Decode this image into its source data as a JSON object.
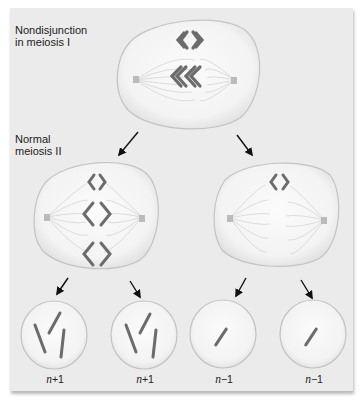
{
  "title_labels": {
    "stage1": "Nondisjunction\nin meiosis I",
    "stage1_line1": "Nondisjunction",
    "stage1_line2": "in meiosis I",
    "stage2_line1": "Normal",
    "stage2_line2": "meiosis II"
  },
  "cells": {
    "parent": {
      "stage": "Nondisjunction in meiosis I",
      "chromosome_pairs": 2
    },
    "meiosis2_left": {
      "stage": "Normal meiosis II",
      "chromosome_pairs": 3
    },
    "meiosis2_right": {
      "stage": "Normal meiosis II",
      "chromosome_pairs": 1
    }
  },
  "gametes": [
    {
      "var": "n",
      "op": "+",
      "num": "1",
      "chromosomes": 3
    },
    {
      "var": "n",
      "op": "+",
      "num": "1",
      "chromosomes": 3
    },
    {
      "var": "n",
      "op": "−",
      "num": "1",
      "chromosomes": 1
    },
    {
      "var": "n",
      "op": "−",
      "num": "1",
      "chromosomes": 1
    }
  ],
  "colors": {
    "background": "#ebebeb",
    "cell_fill": "#f5f5f5",
    "cell_edge": "#bdbdbd",
    "chromosome": "#6f6f6f",
    "spindle": "#d2d2d2",
    "arrow": "#111111"
  }
}
